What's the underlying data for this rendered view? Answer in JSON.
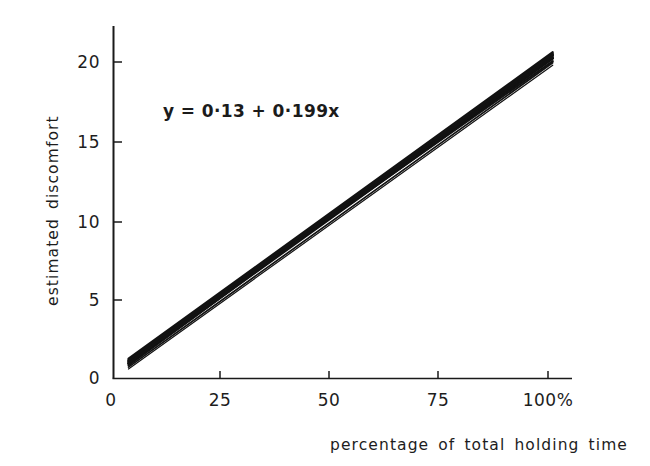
{
  "figure": {
    "background_color": "#ffffff",
    "ink_color": "#1a1a1a"
  },
  "annotation": {
    "equation": "y = 0·13 + 0·199x"
  },
  "axes": {
    "x_title": "percentage  of total holding time",
    "y_title": "estimated discomfort",
    "x_ticks": [
      "0",
      "25",
      "50",
      "75",
      "100%"
    ],
    "y_ticks": [
      "0",
      "5",
      "10",
      "15",
      "20"
    ]
  },
  "chart_data": {
    "type": "line",
    "title": "",
    "subtitle": "",
    "xlabel": "percentage  of total holding time",
    "ylabel": "estimated discomfort",
    "annotations": [
      "y = 0·13 + 0·199x"
    ],
    "xlim": [
      0,
      105
    ],
    "ylim": [
      0,
      22
    ],
    "xticks": [
      0,
      25,
      50,
      75,
      100
    ],
    "xticklabels": [
      "0",
      "25",
      "50",
      "75",
      "100%"
    ],
    "yticks": [
      0,
      5,
      10,
      15,
      20
    ],
    "yticklabels": [
      "0",
      "5",
      "10",
      "15",
      "20"
    ],
    "grid": false,
    "legend": "none",
    "fit_equation": {
      "intercept": 0.13,
      "slope": 0.199
    },
    "x": [
      4,
      101
    ],
    "series": [
      {
        "name": "regression line 1",
        "values": [
          0.93,
          20.23
        ]
      },
      {
        "name": "regression line 2",
        "values": [
          1.05,
          20.45
        ]
      },
      {
        "name": "regression line 3",
        "values": [
          1.18,
          20.05
        ]
      },
      {
        "name": "regression line 4",
        "values": [
          0.82,
          20.55
        ]
      },
      {
        "name": "regression line 5",
        "values": [
          1.1,
          20.3
        ]
      },
      {
        "name": "regression line 6",
        "values": [
          0.72,
          19.95
        ]
      },
      {
        "name": "regression line 7",
        "values": [
          1.25,
          20.62
        ]
      },
      {
        "name": "regression line 8",
        "values": [
          0.98,
          20.4
        ]
      },
      {
        "name": "regression line 9",
        "values": [
          0.6,
          19.8
        ]
      },
      {
        "name": "regression line 10",
        "values": [
          1.15,
          20.5
        ]
      }
    ]
  }
}
